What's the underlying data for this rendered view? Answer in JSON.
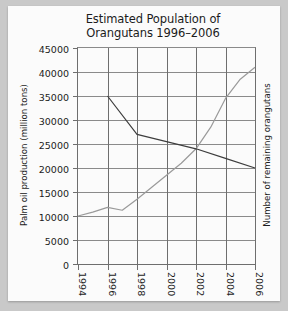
{
  "chart_data": {
    "type": "line",
    "title": "Estimated Population of Orangutans 1996–2006",
    "title_line1": "Estimated Population of",
    "title_line2": "Orangutans 1996–2006",
    "xlabel": "",
    "ylabel": "Palm oil production (million tons)",
    "ylabel_right": "Number of remaining orangutans",
    "xlim": [
      1994,
      2006
    ],
    "ylim": [
      0,
      45000
    ],
    "grid": true,
    "legend": "none",
    "y_ticks": [
      0,
      5000,
      10000,
      15000,
      20000,
      25000,
      30000,
      35000,
      40000,
      45000
    ],
    "y_tick_labels": [
      "0",
      "5000",
      "10000",
      "15000",
      "20000",
      "25000",
      "30000",
      "35000",
      "40000",
      "45000"
    ],
    "x_ticks": [
      1994,
      1996,
      1998,
      2000,
      2002,
      2004,
      2006
    ],
    "x_tick_labels": [
      "1994",
      "1996",
      "1998",
      "2000",
      "2002",
      "2004",
      "2006"
    ],
    "series": [
      {
        "name": "Palm oil production (million tons)",
        "color": "#9a9a9a",
        "x": [
          1994,
          1995,
          1996,
          1997,
          1998,
          1999,
          2000,
          2001,
          2002,
          2003,
          2004,
          2005,
          2006
        ],
        "values": [
          10000,
          10800,
          11800,
          11200,
          13500,
          16000,
          18500,
          21000,
          24000,
          28500,
          34500,
          38500,
          41000
        ]
      },
      {
        "name": "Number of remaining orangutans",
        "color": "#3d3d3d",
        "x": [
          1996,
          1998,
          2000,
          2002,
          2004,
          2006
        ],
        "values": [
          35000,
          27000,
          25500,
          24000,
          22000,
          20000
        ]
      }
    ]
  }
}
